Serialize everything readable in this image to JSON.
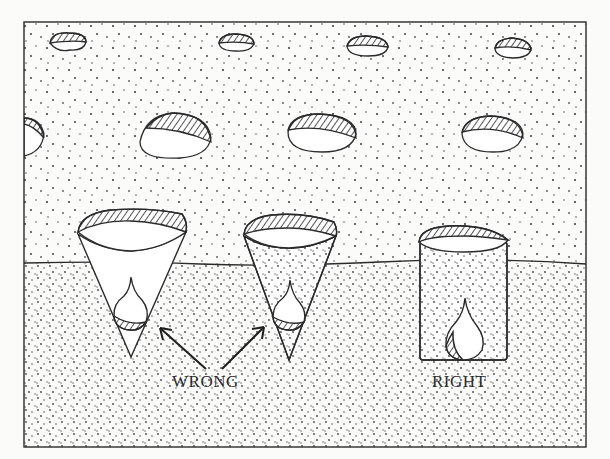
{
  "illustration": {
    "subject": "bulb planting depth diagram",
    "labels": {
      "wrong": "WRONG",
      "right": "RIGHT"
    },
    "colors": {
      "ink": "#2a2a2a",
      "paper": "#fbfbf9"
    },
    "frame": {
      "x": 24,
      "y": 22,
      "width": 562,
      "height": 425
    },
    "ground_line_y": 263,
    "pebbles": [
      {
        "cx": 67,
        "cy": 42,
        "rx": 19,
        "ry": 10
      },
      {
        "cx": 236,
        "cy": 43,
        "rx": 18,
        "ry": 9
      },
      {
        "cx": 368,
        "cy": 46,
        "rx": 21,
        "ry": 10
      },
      {
        "cx": 513,
        "cy": 48,
        "rx": 18,
        "ry": 10
      },
      {
        "cx": 176,
        "cy": 136,
        "rx": 36,
        "ry": 22
      },
      {
        "cx": 322,
        "cy": 133,
        "rx": 34,
        "ry": 19
      },
      {
        "cx": 492,
        "cy": 134,
        "rx": 30,
        "ry": 18
      }
    ],
    "holes": [
      {
        "shape": "cone",
        "label": "wrong",
        "fill": "empty"
      },
      {
        "shape": "cone",
        "label": "wrong",
        "fill": "soil"
      },
      {
        "shape": "cylinder",
        "label": "right",
        "fill": "soil"
      }
    ]
  }
}
